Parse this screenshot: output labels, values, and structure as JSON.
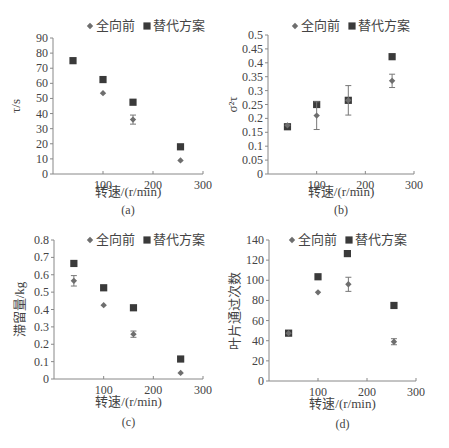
{
  "legend": {
    "series_a": "全向前",
    "series_b": "替代方案"
  },
  "colors": {
    "axis": "#888888",
    "marker_diamond": "#6e6e6e",
    "marker_square": "#3a3a3a",
    "text": "#444444"
  },
  "chart_data": [
    {
      "panel": "(a)",
      "type": "scatter",
      "title": "",
      "xlabel": "转速/(r/min)",
      "ylabel": "τ/s",
      "xlim": [
        0,
        300
      ],
      "ylim": [
        0,
        90
      ],
      "xticks": [
        100,
        200,
        300
      ],
      "yticks": [
        0,
        10,
        20,
        30,
        40,
        50,
        60,
        70,
        80,
        90
      ],
      "grid": false,
      "legend_position": "top",
      "series": [
        {
          "name": "全向前",
          "marker": "diamond",
          "points": [
            {
              "x": 100,
              "y": 53.5
            },
            {
              "x": 160,
              "y": 36,
              "err": 3
            },
            {
              "x": 255,
              "y": 9
            }
          ]
        },
        {
          "name": "替代方案",
          "marker": "square",
          "points": [
            {
              "x": 40,
              "y": 75
            },
            {
              "x": 100,
              "y": 62.5
            },
            {
              "x": 160,
              "y": 47.5
            },
            {
              "x": 255,
              "y": 18
            }
          ]
        }
      ]
    },
    {
      "panel": "(b)",
      "type": "scatter",
      "title": "",
      "xlabel": "转速/(r/min)",
      "ylabel": "σ²τ",
      "xlim": [
        0,
        300
      ],
      "ylim": [
        0,
        0.5
      ],
      "xticks": [
        100,
        200,
        300
      ],
      "yticks": [
        0,
        0.05,
        0.1,
        0.15,
        0.2,
        0.25,
        0.3,
        0.35,
        0.4,
        0.45,
        0.5
      ],
      "grid": false,
      "legend_position": "top",
      "series": [
        {
          "name": "全向前",
          "marker": "diamond",
          "points": [
            {
              "x": 40,
              "y": 0.175
            },
            {
              "x": 100,
              "y": 0.21,
              "err": 0.05
            },
            {
              "x": 165,
              "y": 0.265,
              "err": 0.053
            },
            {
              "x": 255,
              "y": 0.335,
              "err": 0.024
            }
          ]
        },
        {
          "name": "替代方案",
          "marker": "square",
          "points": [
            {
              "x": 40,
              "y": 0.17
            },
            {
              "x": 100,
              "y": 0.25
            },
            {
              "x": 165,
              "y": 0.265
            },
            {
              "x": 255,
              "y": 0.422
            }
          ]
        }
      ]
    },
    {
      "panel": "(c)",
      "type": "scatter",
      "title": "",
      "xlabel": "转速/(r/min)",
      "ylabel": "滞留量/kg",
      "xlim": [
        0,
        300
      ],
      "ylim": [
        0,
        0.8
      ],
      "xticks": [
        100,
        200,
        300
      ],
      "yticks": [
        0,
        0.1,
        0.2,
        0.3,
        0.4,
        0.5,
        0.6,
        0.7,
        0.8
      ],
      "grid": false,
      "legend_position": "top",
      "series": [
        {
          "name": "全向前",
          "marker": "diamond",
          "points": [
            {
              "x": 40,
              "y": 0.565,
              "err": 0.03
            },
            {
              "x": 100,
              "y": 0.425
            },
            {
              "x": 160,
              "y": 0.258,
              "err": 0.018
            },
            {
              "x": 255,
              "y": 0.035
            }
          ]
        },
        {
          "name": "替代方案",
          "marker": "square",
          "points": [
            {
              "x": 40,
              "y": 0.665
            },
            {
              "x": 100,
              "y": 0.525
            },
            {
              "x": 160,
              "y": 0.41
            },
            {
              "x": 255,
              "y": 0.115
            }
          ]
        }
      ]
    },
    {
      "panel": "(d)",
      "type": "scatter",
      "title": "",
      "xlabel": "转速/(r/min)",
      "ylabel": "叶片通过次数",
      "xlim": [
        0,
        300
      ],
      "ylim": [
        0,
        140
      ],
      "xticks": [
        100,
        200,
        300
      ],
      "yticks": [
        0,
        20,
        40,
        60,
        80,
        100,
        120,
        140
      ],
      "grid": false,
      "legend_position": "top",
      "series": [
        {
          "name": "全向前",
          "marker": "diamond",
          "points": [
            {
              "x": 40,
              "y": 47.5
            },
            {
              "x": 100,
              "y": 88
            },
            {
              "x": 162,
              "y": 96,
              "err": 7
            },
            {
              "x": 255,
              "y": 39,
              "err": 3
            }
          ]
        },
        {
          "name": "替代方案",
          "marker": "square",
          "points": [
            {
              "x": 40,
              "y": 47.5
            },
            {
              "x": 100,
              "y": 103.5
            },
            {
              "x": 160,
              "y": 126.5
            },
            {
              "x": 255,
              "y": 75
            }
          ]
        }
      ]
    }
  ]
}
